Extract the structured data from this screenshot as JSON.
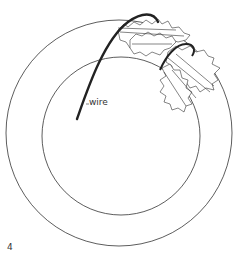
{
  "diagram": {
    "labels": {
      "wire": "wire"
    },
    "step_number": "4",
    "colors": {
      "line": "#333333",
      "wire": "#222222",
      "background": "#ffffff"
    },
    "elements": [
      "outer-wreath-ring",
      "inner-wreath-ring",
      "wire",
      "holly-leaf-cluster-upper",
      "holly-leaf-cluster-lower",
      "wire-wrap-loop"
    ]
  }
}
